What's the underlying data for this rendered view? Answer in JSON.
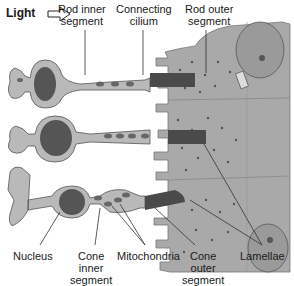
{
  "diagram": {
    "light_label": "Light",
    "labels": {
      "rod_inner_segment": "Rod inner\nsegment",
      "connecting_cilium": "Connecting\ncilium",
      "rod_outer_segment": "Rod outer\nsegment",
      "nucleus": "Nucleus",
      "cone_inner_segment": "Cone\ninner\nsegment",
      "mitochondria": "Mitochondria",
      "cone_outer_segment": "Cone\nouter\nsegment",
      "lamellae": "Lamellae"
    },
    "colors": {
      "cell_fill": "#b9b9b9",
      "epithelium_fill": "#a9a9a9",
      "nucleus_fill": "#555555",
      "outer_segment_fill": "#4a4a4a",
      "outline": "#555555",
      "leader_line": "#333333"
    }
  }
}
